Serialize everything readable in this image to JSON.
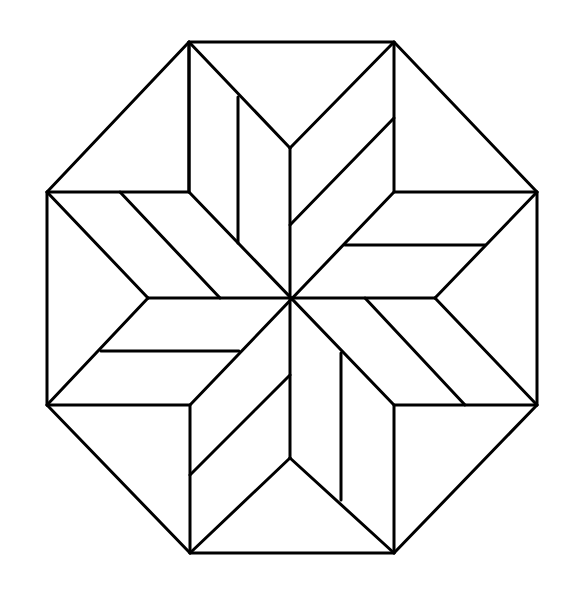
{
  "diagram": {
    "stroke_color": "#000000",
    "background_color": "#ffffff",
    "octagon": [
      [
        189,
        42
      ],
      [
        394,
        42
      ],
      [
        537,
        192
      ],
      [
        537,
        405
      ],
      [
        394,
        553
      ],
      [
        190,
        553
      ],
      [
        47,
        405
      ],
      [
        47,
        192
      ]
    ],
    "inner_square": [
      [
        189,
        192
      ],
      [
        394,
        192
      ],
      [
        394,
        405
      ],
      [
        190,
        405
      ]
    ],
    "center": [
      290,
      298
    ],
    "star_points": {
      "top": [
        290,
        148
      ],
      "right": [
        435,
        298
      ],
      "bottom": [
        290,
        458
      ],
      "left": [
        148,
        298
      ]
    }
  }
}
